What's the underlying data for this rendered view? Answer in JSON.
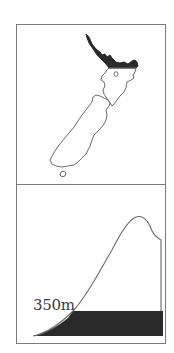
{
  "figure": {
    "top_panel": {
      "title": "",
      "description": "Outline map of New Zealand with the northern region (Northland/Auckland) shaded",
      "shaded_region": "north-north-island",
      "colors": {
        "outline": "#6a6a6a",
        "shade": "#2a2a2a",
        "background": "#ffffff"
      }
    },
    "bottom_panel": {
      "description": "Elevation profile silhouette with shaded band below marked altitude",
      "altitude_label": "350m",
      "colors": {
        "outline": "#6a6a6a",
        "shade": "#2a2a2a"
      }
    },
    "frame_color": "#7a7a7a"
  }
}
